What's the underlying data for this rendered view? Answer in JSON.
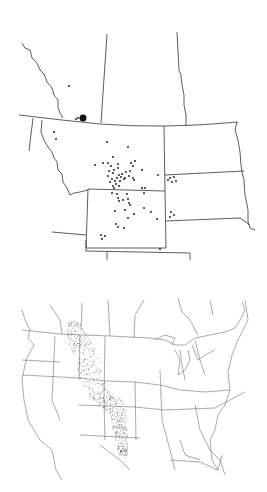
{
  "figure": {
    "panels": [
      {
        "id": "regional-map",
        "description": "Regional distribution map: records in Alberta/Saskatchewan, Montana, Wyoming, Dakotas",
        "large_marker": {
          "x": 83,
          "y": 118,
          "r": 3.5
        },
        "records": [
          [
            69,
            86
          ],
          [
            76,
            119
          ],
          [
            78,
            118
          ],
          [
            54,
            132
          ],
          [
            56,
            139
          ],
          [
            107,
            142
          ],
          [
            128,
            147
          ],
          [
            113,
            157
          ],
          [
            95,
            165
          ],
          [
            103,
            163
          ],
          [
            108,
            163
          ],
          [
            111,
            166
          ],
          [
            118,
            164
          ],
          [
            131,
            163
          ],
          [
            135,
            161
          ],
          [
            133,
            166
          ],
          [
            109,
            171
          ],
          [
            114,
            170
          ],
          [
            118,
            168
          ],
          [
            142,
            170
          ],
          [
            158,
            175
          ],
          [
            108,
            176
          ],
          [
            113,
            173
          ],
          [
            119,
            175
          ],
          [
            122,
            174
          ],
          [
            126,
            172
          ],
          [
            130,
            171
          ],
          [
            112,
            179
          ],
          [
            117,
            178
          ],
          [
            121,
            177
          ],
          [
            125,
            178
          ],
          [
            133,
            178
          ],
          [
            110,
            182
          ],
          [
            115,
            181
          ],
          [
            120,
            181
          ],
          [
            124,
            179
          ],
          [
            116,
            184
          ],
          [
            129,
            176
          ],
          [
            113,
            186
          ],
          [
            119,
            186
          ],
          [
            134,
            180
          ],
          [
            170,
            178
          ],
          [
            174,
            177
          ],
          [
            168,
            180
          ],
          [
            172,
            182
          ],
          [
            176,
            181
          ],
          [
            114,
            188
          ],
          [
            142,
            188
          ],
          [
            145,
            188
          ],
          [
            112,
            193
          ],
          [
            117,
            194
          ],
          [
            127,
            194
          ],
          [
            144,
            193
          ],
          [
            118,
            198
          ],
          [
            123,
            200
          ],
          [
            128,
            199
          ],
          [
            130,
            205
          ],
          [
            119,
            201
          ],
          [
            129,
            203
          ],
          [
            125,
            210
          ],
          [
            144,
            208
          ],
          [
            151,
            212
          ],
          [
            115,
            211
          ],
          [
            134,
            214
          ],
          [
            128,
            218
          ],
          [
            157,
            219
          ],
          [
            116,
            224
          ],
          [
            118,
            227
          ],
          [
            124,
            228
          ],
          [
            171,
            212
          ],
          [
            174,
            215
          ],
          [
            170,
            217
          ],
          [
            101,
            235
          ],
          [
            105,
            236
          ],
          [
            102,
            239
          ],
          [
            160,
            249
          ],
          [
            159,
            262
          ]
        ],
        "colors": {
          "line": "#333333",
          "dot": "#111111",
          "background": "#ffffff"
        }
      },
      {
        "id": "continental-map",
        "description": "North American range map with stippled range along the Great Plains from Alberta to Texas",
        "stipple_density": 700,
        "colors": {
          "line": "#555555",
          "stipple": "#222222",
          "background": "#ffffff"
        }
      }
    ]
  }
}
